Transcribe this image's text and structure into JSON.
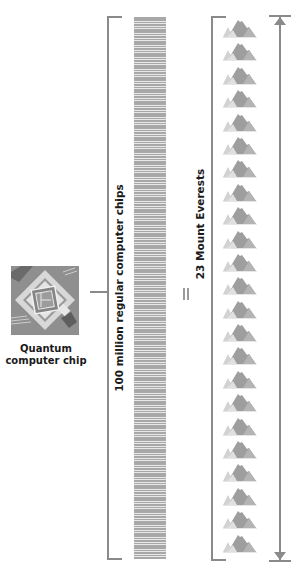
{
  "quantum_chip": {
    "label_line1": "Quantum",
    "label_line2": "computer chip",
    "icon": "quantum-chip-icon"
  },
  "regular_chips": {
    "label": "100 million regular computer chips",
    "icon": "chip-stack-icon"
  },
  "equals": {
    "symbol": "="
  },
  "everests": {
    "label": "23 Mount Everests",
    "count": 23,
    "icon": "mountain-icon"
  },
  "colors": {
    "line": "#8a8a8a",
    "chip_dark": "#8f8f8f",
    "chip_light": "#d6d6d6",
    "mountain_main": "#9e9e9e",
    "mountain_light": "#d2d2d2",
    "text": "#1a1a1a"
  }
}
